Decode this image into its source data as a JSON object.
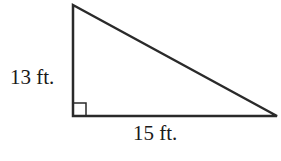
{
  "diagram": {
    "type": "right-triangle",
    "labels": {
      "height": "13 ft.",
      "base": "15 ft."
    },
    "vertices": {
      "top": [
        73,
        5
      ],
      "right_angle": [
        73,
        116
      ],
      "right": [
        277,
        116
      ]
    },
    "right_angle_marker": true,
    "colors": {
      "stroke": "#2a2a2a",
      "background": "#ffffff"
    }
  }
}
